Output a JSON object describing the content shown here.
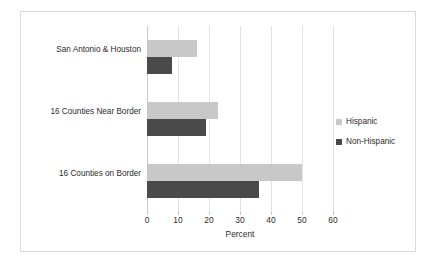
{
  "chart_data": {
    "type": "bar",
    "orientation": "horizontal",
    "title": "",
    "xlabel": "Percent",
    "ylabel": "",
    "xlim": [
      0,
      60
    ],
    "xticks": [
      0,
      10,
      20,
      30,
      40,
      50,
      60
    ],
    "xtick_labels": [
      "0",
      "10",
      "20",
      "30",
      "40",
      "50",
      "60"
    ],
    "grid": true,
    "grid_axis": "x",
    "legend_position": "right",
    "categories": [
      "San Antonio & Houston",
      "16 Counties Near Border",
      "16 Counties on Border"
    ],
    "series": [
      {
        "name": "Hispanic",
        "color": "#c8c8c8",
        "values": [
          16,
          23,
          50
        ]
      },
      {
        "name": "Non-Hispanic",
        "color": "#4a4a4a",
        "values": [
          8,
          19,
          36
        ]
      }
    ]
  },
  "colors": {
    "hispanic": "#c8c8c8",
    "non_hispanic": "#4a4a4a",
    "gridline": "#e3e3e3",
    "axis": "#c9c9c9",
    "frame_border": "#d9d9d9",
    "text": "#2b2b2b",
    "background": "#ffffff"
  }
}
